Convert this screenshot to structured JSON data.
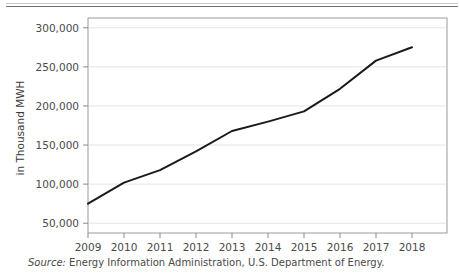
{
  "figure": {
    "title_partial": "",
    "source_lead": "Source:",
    "source_text": " Energy Information Administration, U.S. Department of Energy."
  },
  "chart_data": {
    "type": "line",
    "title": "",
    "subtitle": "",
    "xlabel": "",
    "ylabel": "in Thousand MWH",
    "x": [
      "2009",
      "2010",
      "2011",
      "2012",
      "2013",
      "2014",
      "2015",
      "2016",
      "2017",
      "2018"
    ],
    "categories": [
      "2009",
      "2010",
      "2011",
      "2012",
      "2013",
      "2014",
      "2015",
      "2016",
      "2017",
      "2018"
    ],
    "values": [
      75000,
      102000,
      118000,
      142000,
      168000,
      180000,
      193000,
      222000,
      258000,
      275000
    ],
    "series": [
      {
        "name": "Renewable generation",
        "values": [
          75000,
          102000,
          118000,
          142000,
          168000,
          180000,
          193000,
          222000,
          258000,
          275000
        ],
        "color": "#1a1a1a"
      }
    ],
    "ylim": [
      37500,
      312500
    ],
    "yticks": [
      50000,
      100000,
      150000,
      200000,
      250000,
      300000
    ],
    "ytick_labels": [
      "50,000",
      "100,000",
      "150,000",
      "200,000",
      "250,000",
      "300,000"
    ],
    "xtick_labels": [
      "2009",
      "2010",
      "2011",
      "2012",
      "2013",
      "2014",
      "2015",
      "2016",
      "2017",
      "2018"
    ],
    "grid": "horizontal",
    "legend": "none",
    "line_color": "#1a1a1a",
    "plot_border_color": "#9a9a9a",
    "grid_color": "#e4e4e4"
  }
}
